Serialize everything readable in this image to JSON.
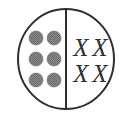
{
  "figure": {
    "name": "divided-circle-diagram",
    "background_color": "#ffffff",
    "outline_color": "#2f2f2f",
    "outline_width": 2,
    "circle": {
      "center_x": 66,
      "center_y": 59,
      "radius_x": 48,
      "radius_y": 50
    },
    "divider": {
      "label": "vertical-divider",
      "x": 66,
      "y_top": 9,
      "y_bottom": 109,
      "width": 2,
      "color": "#2f2f2f"
    },
    "left_half": {
      "label": "dots-half",
      "item_count": 6,
      "item_kind": "filled-dot",
      "dot_color": "#7f7f7f",
      "dot_edge_color": "#6a6a6a",
      "dot_radius": 7,
      "dots": [
        {
          "id": "dot-1",
          "row": 1,
          "col": 1,
          "cx": 36,
          "cy": 38
        },
        {
          "id": "dot-2",
          "row": 1,
          "col": 2,
          "cx": 54,
          "cy": 38
        },
        {
          "id": "dot-3",
          "row": 2,
          "col": 1,
          "cx": 36,
          "cy": 59
        },
        {
          "id": "dot-4",
          "row": 2,
          "col": 2,
          "cx": 54,
          "cy": 59
        },
        {
          "id": "dot-5",
          "row": 3,
          "col": 1,
          "cx": 36,
          "cy": 80
        },
        {
          "id": "dot-6",
          "row": 3,
          "col": 2,
          "cx": 54,
          "cy": 80
        }
      ]
    },
    "right_half": {
      "label": "x-marks-half",
      "item_count": 4,
      "item_kind": "x-mark",
      "mark_color": "#2f2f2f",
      "mark_glyph": "X",
      "font_size": 25,
      "marks": [
        {
          "id": "x-mark-1",
          "row": 1,
          "col": 1,
          "cx": 81,
          "cy": 47,
          "glyph": "X"
        },
        {
          "id": "x-mark-2",
          "row": 1,
          "col": 2,
          "cx": 100,
          "cy": 47,
          "glyph": "X"
        },
        {
          "id": "x-mark-3",
          "row": 2,
          "col": 1,
          "cx": 81,
          "cy": 73,
          "glyph": "X"
        },
        {
          "id": "x-mark-4",
          "row": 2,
          "col": 2,
          "cx": 100,
          "cy": 73,
          "glyph": "X"
        }
      ]
    }
  }
}
